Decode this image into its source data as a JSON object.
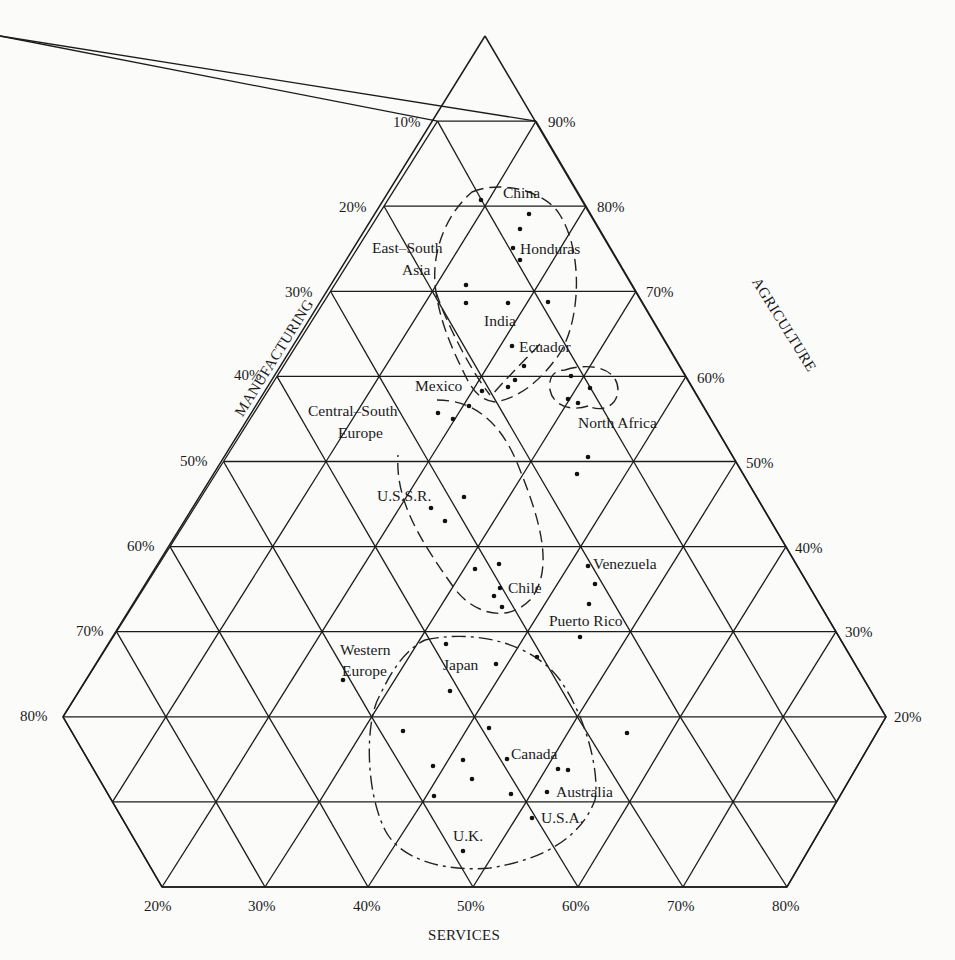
{
  "chart_data": {
    "type": "scatter",
    "subtype": "ternary",
    "title": "",
    "axes": {
      "manufacturing": {
        "label": "MANUFACTURING",
        "side": "left",
        "ticks": [
          "10%",
          "20%",
          "30%",
          "40%",
          "50%",
          "60%",
          "70%",
          "80%"
        ]
      },
      "agriculture": {
        "label": "AGRICULTURE",
        "side": "right",
        "ticks": [
          "90%",
          "80%",
          "70%",
          "60%",
          "50%",
          "40%",
          "30%",
          "20%"
        ]
      },
      "services": {
        "label": "SERVICES",
        "side": "bottom",
        "ticks": [
          "20%",
          "30%",
          "40%",
          "50%",
          "60%",
          "70%",
          "80%"
        ]
      }
    },
    "grid": true,
    "shape": "truncated triangle (hexagon), 10% grid spacing",
    "labeled_points": [
      {
        "label": "China",
        "agriculture": 80,
        "manufacturing": 18,
        "services": 2
      },
      {
        "label": "Honduras",
        "agriculture": 77,
        "manufacturing": 9,
        "services": 14
      },
      {
        "label": "India",
        "agriculture": 69,
        "manufacturing": 13,
        "services": 18
      },
      {
        "label": "Ecuador",
        "agriculture": 64,
        "manufacturing": 11,
        "services": 25
      },
      {
        "label": "Mexico",
        "agriculture": 60,
        "manufacturing": 10,
        "services": 30
      },
      {
        "label": "Central-South Europe",
        "agriculture": 56,
        "manufacturing": 24,
        "services": 20
      },
      {
        "label": "U.S.S.R.",
        "agriculture": 47,
        "manufacturing": 22,
        "services": 31
      },
      {
        "label": "Chile",
        "agriculture": 36,
        "manufacturing": 15,
        "services": 49
      },
      {
        "label": "Venezuela",
        "agriculture": 38,
        "manufacturing": 4,
        "services": 58
      },
      {
        "label": "Puerto Rico",
        "agriculture": 31,
        "manufacturing": 2,
        "services": 67
      },
      {
        "label": "Japan",
        "agriculture": 26,
        "manufacturing": 14,
        "services": 60
      },
      {
        "label": "Western Europe",
        "agriculture": 24,
        "manufacturing": 36,
        "services": 40
      },
      {
        "label": "Canada",
        "agriculture": 15,
        "manufacturing": 18,
        "services": 67
      },
      {
        "label": "Australia",
        "agriculture": 11,
        "manufacturing": 13,
        "services": 76
      },
      {
        "label": "U.S.A.",
        "agriculture": 8,
        "manufacturing": 14,
        "services": 78
      },
      {
        "label": "U.K.",
        "agriculture": 4,
        "manufacturing": 25,
        "services": 71
      }
    ],
    "group_labels": [
      "East-South Asia",
      "North Africa",
      "Central-South Europe",
      "Western Europe"
    ],
    "pixel_points": [
      [
        481,
        200
      ],
      [
        529,
        214
      ],
      [
        520,
        229
      ],
      [
        513,
        248
      ],
      [
        520,
        260
      ],
      [
        466,
        285
      ],
      [
        466,
        303
      ],
      [
        508,
        303
      ],
      [
        548,
        302
      ],
      [
        512,
        346
      ],
      [
        524,
        366
      ],
      [
        515,
        380
      ],
      [
        508,
        387
      ],
      [
        482,
        391
      ],
      [
        571,
        376
      ],
      [
        590,
        388
      ],
      [
        568,
        399
      ],
      [
        578,
        403
      ],
      [
        588,
        457
      ],
      [
        577,
        474
      ],
      [
        438,
        413
      ],
      [
        453,
        419
      ],
      [
        469,
        406
      ],
      [
        464,
        497
      ],
      [
        431,
        508
      ],
      [
        445,
        521
      ],
      [
        475,
        569
      ],
      [
        499,
        564
      ],
      [
        500,
        588
      ],
      [
        494,
        596
      ],
      [
        502,
        607
      ],
      [
        588,
        566
      ],
      [
        595,
        584
      ],
      [
        589,
        604
      ],
      [
        580,
        637
      ],
      [
        446,
        644
      ],
      [
        496,
        664
      ],
      [
        343,
        680
      ],
      [
        450,
        691
      ],
      [
        537,
        657
      ],
      [
        403,
        731
      ],
      [
        489,
        728
      ],
      [
        627,
        733
      ],
      [
        433,
        766
      ],
      [
        463,
        760
      ],
      [
        507,
        759
      ],
      [
        558,
        769
      ],
      [
        568,
        770
      ],
      [
        472,
        779
      ],
      [
        434,
        796
      ],
      [
        511,
        794
      ],
      [
        547,
        792
      ],
      [
        532,
        818
      ],
      [
        463,
        851
      ]
    ]
  },
  "labels": {
    "left_ticks": [
      {
        "text": "10%",
        "x": 393,
        "y": 127
      },
      {
        "text": "20%",
        "x": 339,
        "y": 212
      },
      {
        "text": "30%",
        "x": 285,
        "y": 297
      },
      {
        "text": "40%",
        "x": 234,
        "y": 380
      },
      {
        "text": "50%",
        "x": 180,
        "y": 466
      },
      {
        "text": "60%",
        "x": 127,
        "y": 551
      },
      {
        "text": "70%",
        "x": 76,
        "y": 636
      },
      {
        "text": "80%",
        "x": 20,
        "y": 721
      }
    ],
    "right_ticks": [
      {
        "text": "90%",
        "x": 548,
        "y": 127
      },
      {
        "text": "80%",
        "x": 597,
        "y": 212
      },
      {
        "text": "70%",
        "x": 646,
        "y": 297
      },
      {
        "text": "60%",
        "x": 697,
        "y": 383
      },
      {
        "text": "50%",
        "x": 746,
        "y": 468
      },
      {
        "text": "40%",
        "x": 795,
        "y": 553
      },
      {
        "text": "30%",
        "x": 845,
        "y": 637
      },
      {
        "text": "20%",
        "x": 894,
        "y": 722
      }
    ],
    "bottom_ticks": [
      {
        "text": "20%",
        "x": 144,
        "y": 911
      },
      {
        "text": "30%",
        "x": 248,
        "y": 911
      },
      {
        "text": "40%",
        "x": 353,
        "y": 911
      },
      {
        "text": "50%",
        "x": 457,
        "y": 911
      },
      {
        "text": "60%",
        "x": 562,
        "y": 911
      },
      {
        "text": "70%",
        "x": 667,
        "y": 911
      },
      {
        "text": "80%",
        "x": 772,
        "y": 911
      }
    ],
    "axis_titles": {
      "services": {
        "text": "SERVICES",
        "x": 428,
        "y": 940
      },
      "manufacturing": {
        "text": "MANUFACTURING",
        "x": 232,
        "y": 340
      },
      "agriculture": {
        "text": "AGRICULTURE",
        "x": 744,
        "y": 345
      }
    },
    "countries": [
      {
        "text": "China",
        "x": 503,
        "y": 198
      },
      {
        "text": "Honduras",
        "x": 520,
        "y": 254
      },
      {
        "text": "East–South",
        "x": 372,
        "y": 253
      },
      {
        "text": "Asia",
        "x": 402,
        "y": 275
      },
      {
        "text": "India",
        "x": 484,
        "y": 326
      },
      {
        "text": "Ecuador",
        "x": 519,
        "y": 352
      },
      {
        "text": "Mexico",
        "x": 415,
        "y": 391
      },
      {
        "text": "Central–South",
        "x": 308,
        "y": 416
      },
      {
        "text": "Europe",
        "x": 338,
        "y": 438
      },
      {
        "text": "North Africa",
        "x": 578,
        "y": 428
      },
      {
        "text": "U.S.S.R.",
        "x": 377,
        "y": 501
      },
      {
        "text": "Venezuela",
        "x": 593,
        "y": 569
      },
      {
        "text": "Chile",
        "x": 508,
        "y": 593
      },
      {
        "text": "Puerto Rico",
        "x": 549,
        "y": 626
      },
      {
        "text": "Western",
        "x": 340,
        "y": 655
      },
      {
        "text": "Europe",
        "x": 342,
        "y": 676
      },
      {
        "text": "Japan",
        "x": 443,
        "y": 670
      },
      {
        "text": "Canada",
        "x": 511,
        "y": 759
      },
      {
        "text": "Australia",
        "x": 556,
        "y": 797
      },
      {
        "text": "U.S.A.",
        "x": 541,
        "y": 823
      },
      {
        "text": "U.K.",
        "x": 453,
        "y": 841
      }
    ]
  },
  "colors": {
    "background": "#fbfbfa",
    "ink": "#1c1c1c"
  }
}
